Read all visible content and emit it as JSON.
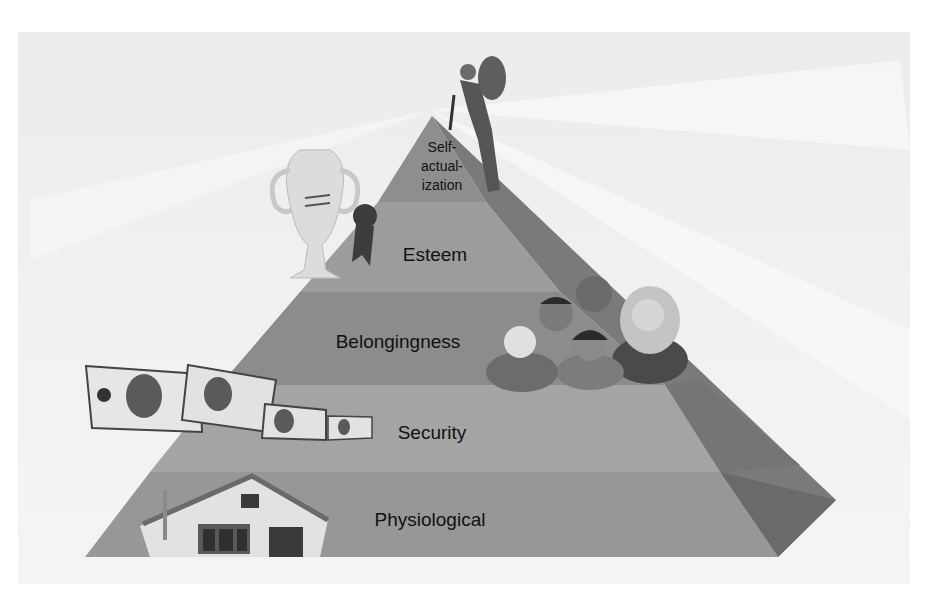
{
  "diagram": {
    "levels": [
      {
        "label_lines": [
          "Self-",
          "actual-",
          "ization"
        ],
        "illustration": "climber-with-backpack"
      },
      {
        "label": "Esteem",
        "illustration": "trophy-and-ribbon"
      },
      {
        "label": "Belongingness",
        "illustration": "group-of-people"
      },
      {
        "label": "Security",
        "illustration": "flying-dollar-bills"
      },
      {
        "label": "Physiological",
        "illustration": "house"
      }
    ],
    "colors": {
      "level1": "#8f8f8f",
      "level2": "#9a9a9a",
      "level3": "#8c8c8c",
      "level4": "#a3a3a3",
      "level5": "#969696",
      "side": "#6e6e6e",
      "background": "#efefef"
    }
  }
}
